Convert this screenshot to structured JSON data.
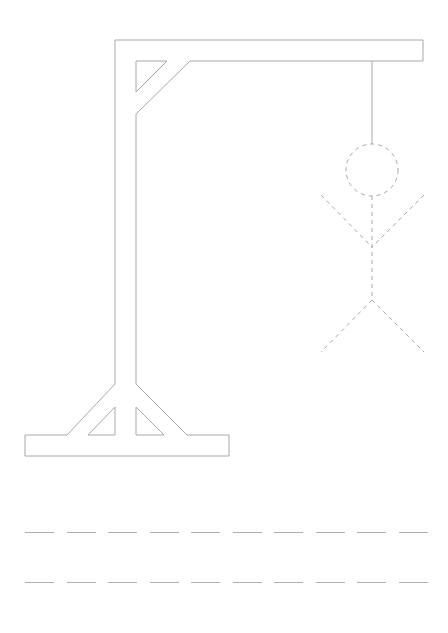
{
  "game": {
    "title": "Hangman",
    "wrong_guesses": 6,
    "max_wrong_guesses": 6,
    "colors": {
      "gallows": "#a8a8a8",
      "figure": "#a8a8a8",
      "blank": "#b0b0b0"
    }
  },
  "gallows": {
    "outer": "115,456 25,456 25,435 67,435 115,384 115,40 423,40 423,61 190,61 136,114 136,384 187,435 229,435 229,456",
    "top_triangle": "136,61 167,61 136,92",
    "bottom_left_triangle": "88,435 115,407 115,435",
    "bottom_right_triangle": "136,407 136,435 164,435",
    "rope": {
      "x": 372,
      "y1": 61,
      "y2": 144
    }
  },
  "figure": {
    "head": {
      "cx": 372,
      "cy": 170,
      "r": 26
    },
    "body": {
      "x1": 372,
      "y1": 196,
      "x2": 372,
      "y2": 300
    },
    "left_arm": {
      "x1": 321,
      "y1": 195,
      "x2": 372,
      "y2": 247
    },
    "right_arm": {
      "x1": 424,
      "y1": 195,
      "x2": 372,
      "y2": 247
    },
    "left_leg": {
      "x1": 372,
      "y1": 300,
      "x2": 321,
      "y2": 352
    },
    "right_leg": {
      "x1": 372,
      "y1": 300,
      "x2": 424,
      "y2": 352
    }
  },
  "word_rows": [
    {
      "y": 522,
      "letters": [
        "",
        "",
        "",
        "",
        "",
        "",
        "",
        "",
        "",
        ""
      ]
    },
    {
      "y": 572,
      "letters": [
        "",
        "",
        "",
        "",
        "",
        "",
        "",
        "",
        "",
        ""
      ]
    }
  ]
}
